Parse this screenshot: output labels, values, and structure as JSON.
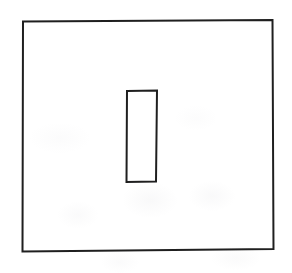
{
  "image": {
    "kind": "scanned-line-drawing",
    "width": 292,
    "height": 273,
    "background_color": "#ffffff",
    "ink_color": "#1a1a1a",
    "caption": ""
  },
  "shapes": [
    {
      "name": "outer-rectangle",
      "role": "frame",
      "stroke_color": "#1f1f1f",
      "stroke_width": 2,
      "fill": "none",
      "x": 22,
      "y": 20,
      "width": 251,
      "height": 231,
      "path": "M 23.0 21.5 L 272.5 20.0 L 273.5 249.0 L 22.5 251.5 Z"
    },
    {
      "name": "inner-rectangle",
      "role": "vertical-bar",
      "stroke_color": "#1f1f1f",
      "stroke_width": 2,
      "fill": "none",
      "x": 126,
      "y": 90,
      "width": 31,
      "height": 92,
      "path": "M 127.0 91.0 L 157.0 90.5 L 156.0 181.5 L 126.5 182.0 Z"
    }
  ]
}
